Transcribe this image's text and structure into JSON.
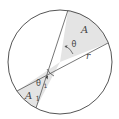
{
  "diagram": {
    "type": "circle-sectors",
    "colors": {
      "stroke": "#555555",
      "sector_fill": "#e4e4e4",
      "background": "#ffffff",
      "text": "#444444"
    },
    "circle": {
      "cx": 60,
      "cy": 62,
      "r": 52
    },
    "labels": {
      "sector_A": "A",
      "angle_theta": "θ",
      "radius_r": "r",
      "sector_A1_main": "A",
      "sector_A1_sub": "1",
      "angle_theta1_main": "θ",
      "angle_theta1_sub": "1"
    }
  }
}
